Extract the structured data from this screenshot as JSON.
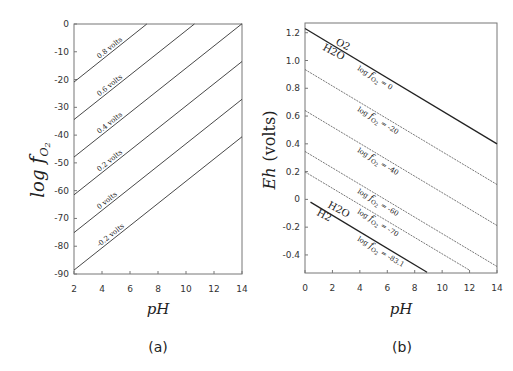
{
  "chart_data": [
    {
      "panel": "(a)",
      "type": "line",
      "title": "",
      "xlabel": "pH",
      "ylabel": "log fO2",
      "xlim": [
        2,
        14
      ],
      "ylim": [
        -90,
        0
      ],
      "xticks": [
        2,
        4,
        6,
        8,
        10,
        12,
        14
      ],
      "yticks": [
        0,
        -10,
        -20,
        -30,
        -40,
        -50,
        -60,
        -70,
        -80,
        -90
      ],
      "grid": false,
      "series": [
        {
          "name": "0.8 volts",
          "label": "0.8 volts",
          "x": [
            2,
            7.2
          ],
          "y": [
            -20.9,
            0
          ]
        },
        {
          "name": "0.6 volts",
          "label": "0.6 volts",
          "x": [
            2,
            10.6
          ],
          "y": [
            -34.4,
            0
          ]
        },
        {
          "name": "0.4 volts",
          "label": "0.4 volts",
          "x": [
            2,
            14
          ],
          "y": [
            -47.9,
            0.1
          ]
        },
        {
          "name": "0.2 volts",
          "label": "0.2 volts",
          "x": [
            2,
            14
          ],
          "y": [
            -61.5,
            -13.5
          ]
        },
        {
          "name": "0 volts",
          "label": "0 volts",
          "x": [
            2,
            14
          ],
          "y": [
            -75.1,
            -27.1
          ]
        },
        {
          "name": "-0.2 volts",
          "label": "-0.2 volts",
          "x": [
            2,
            14
          ],
          "y": [
            -88.6,
            -40.6
          ]
        }
      ]
    },
    {
      "panel": "(b)",
      "type": "line",
      "title": "",
      "xlabel": "pH",
      "ylabel": "Eh (volts)",
      "xlim": [
        0,
        14
      ],
      "ylim": [
        -0.53,
        1.27
      ],
      "xticks": [
        0,
        2,
        4,
        6,
        8,
        10,
        12,
        14
      ],
      "yticks": [
        1.2,
        1.0,
        0.8,
        0.6,
        0.4,
        0.2,
        0,
        -0.2,
        -0.4
      ],
      "grid": false,
      "annotations": [
        "O2 / H2O",
        "H2O / H2"
      ],
      "series": [
        {
          "name": "log fO2 = 0",
          "label": "log fO2 = 0",
          "style": "solid-bold",
          "x": [
            0,
            14
          ],
          "y": [
            1.23,
            0.4
          ]
        },
        {
          "name": "log fO2 = -20",
          "label": "log fO2 = -20",
          "style": "dotted",
          "x": [
            0,
            14
          ],
          "y": [
            0.935,
            0.107
          ]
        },
        {
          "name": "log fO2 = -40",
          "label": "log fO2 = -40",
          "style": "dotted",
          "x": [
            0,
            14
          ],
          "y": [
            0.64,
            -0.188
          ]
        },
        {
          "name": "log fO2 = -60",
          "label": "log fO2 = -60",
          "style": "dotted",
          "x": [
            0,
            14
          ],
          "y": [
            0.345,
            -0.483
          ]
        },
        {
          "name": "log fO2 = -70",
          "label": "log fO2 = -70",
          "style": "dotted",
          "x": [
            0,
            12
          ],
          "y": [
            0.198,
            -0.51
          ]
        },
        {
          "name": "log fO2 = -83.1",
          "label": "log fO2 = -83.1",
          "style": "solid-bold",
          "x": [
            0.4,
            8.9
          ],
          "y": [
            -0.02,
            -0.525
          ]
        }
      ]
    }
  ],
  "panel_a": {
    "ylabel_main": "log ",
    "ylabel_f": "f",
    "ylabel_sub": "O",
    "ylabel_sub2": "2",
    "xlabel": "pH",
    "caption": "(a)",
    "yticks": [
      "0",
      "-10",
      "-20",
      "-30",
      "-40",
      "-50",
      "-60",
      "-70",
      "-80",
      "-90"
    ],
    "xticks": [
      "2",
      "4",
      "6",
      "8",
      "10",
      "12",
      "14"
    ],
    "labels": [
      "0.8 volts",
      "0.6 volts",
      "0.4 volts",
      "0.2 volts",
      "0 volts",
      "-0.2 volts"
    ]
  },
  "panel_b": {
    "ylabel": "Eh  (volts)",
    "ylabel_eh": "Eh",
    "ylabel_unit": "(volts)",
    "xlabel": "pH",
    "caption": "(b)",
    "yticks": [
      "1.2",
      "1.0",
      "0.8",
      "0.6",
      "0.4",
      "0.2",
      "0",
      "-0.2",
      "-0.4"
    ],
    "xticks": [
      "0",
      "2",
      "4",
      "6",
      "8",
      "10",
      "12",
      "14"
    ],
    "labels": [
      "log fO2 = 0",
      "log fO2 = -20",
      "log fO2 = -40",
      "log fO2 = -60",
      "log fO2 = -70",
      "log fO2 = -83.1"
    ],
    "label_values": [
      "0",
      "-20",
      "-40",
      "-60",
      "-70",
      "-83.1"
    ],
    "species_top": [
      "O2",
      "H2O"
    ],
    "species_bottom": [
      "H2O",
      "H2"
    ]
  }
}
